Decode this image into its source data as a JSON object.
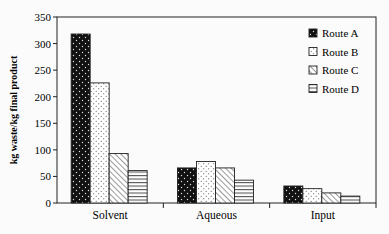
{
  "chart_data": {
    "type": "bar",
    "title": "",
    "xlabel": "",
    "ylabel": "kg waste/kg final product",
    "ylim": [
      0,
      350
    ],
    "yticks": [
      0,
      50,
      100,
      150,
      200,
      250,
      300,
      350
    ],
    "categories": [
      "Solvent",
      "Aqueous",
      "Input"
    ],
    "series": [
      {
        "name": "Route A",
        "pattern": "dots-on-black",
        "values": [
          318,
          66,
          32
        ]
      },
      {
        "name": "Route B",
        "pattern": "dots-on-white",
        "values": [
          226,
          78,
          27
        ]
      },
      {
        "name": "Route C",
        "pattern": "diagonal-hatch",
        "values": [
          93,
          66,
          19
        ]
      },
      {
        "name": "Route D",
        "pattern": "horizontal-lines",
        "values": [
          61,
          43,
          13
        ]
      }
    ],
    "grid": false,
    "legend_position": "upper-right-inside"
  },
  "colors": {
    "ink": "#111111",
    "background": "#fbfbfb"
  }
}
